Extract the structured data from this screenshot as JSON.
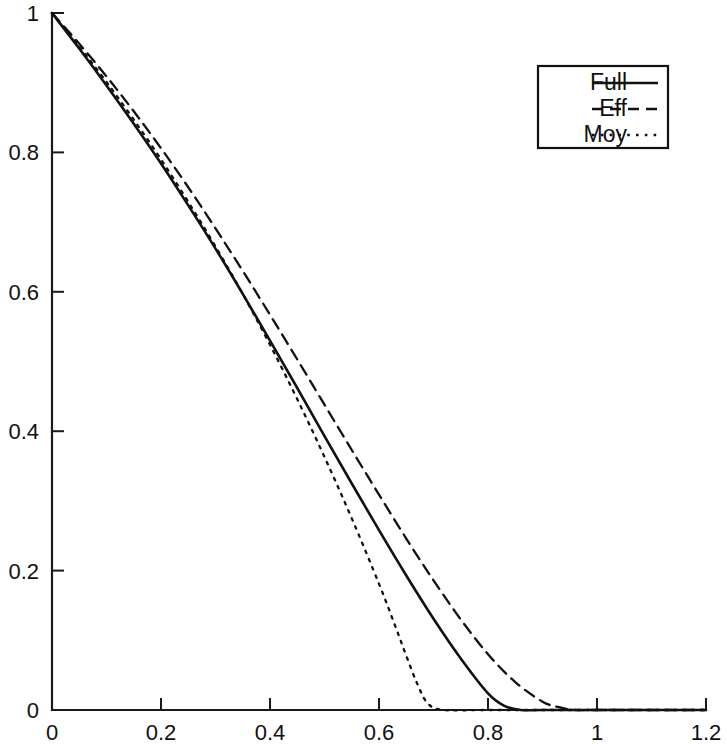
{
  "chart_data": {
    "type": "line",
    "title": "",
    "subtitle": "",
    "xlabel": "",
    "ylabel": "",
    "xlim": [
      0,
      1.2
    ],
    "ylim": [
      0,
      1
    ],
    "grid": false,
    "legend_position": "top-right",
    "xticks": [
      0,
      0.2,
      0.4,
      0.6,
      0.8,
      1,
      1.2
    ],
    "xtick_labels": [
      "0",
      "0.2",
      "0.4",
      "0.6",
      "0.8",
      "1",
      "1.2"
    ],
    "yticks": [
      0,
      0.2,
      0.4,
      0.6,
      0.8,
      1
    ],
    "ytick_labels": [
      "0",
      "0.2",
      "0.4",
      "0.6",
      "0.8",
      "1"
    ],
    "series": [
      {
        "name": "Full",
        "style": "solid",
        "x": [
          0,
          0.05,
          0.1,
          0.15,
          0.2,
          0.25,
          0.3,
          0.35,
          0.4,
          0.45,
          0.5,
          0.55,
          0.6,
          0.65,
          0.7,
          0.75,
          0.8,
          0.83,
          0.86,
          0.9,
          1.0,
          1.2
        ],
        "values": [
          1.0,
          0.949,
          0.896,
          0.841,
          0.784,
          0.724,
          0.662,
          0.597,
          0.53,
          0.462,
          0.393,
          0.325,
          0.258,
          0.193,
          0.131,
          0.074,
          0.024,
          0.006,
          0.0,
          0.0,
          0.0,
          0.0
        ]
      },
      {
        "name": "Eff",
        "style": "dashed",
        "x": [
          0,
          0.05,
          0.1,
          0.15,
          0.2,
          0.25,
          0.3,
          0.35,
          0.4,
          0.45,
          0.5,
          0.55,
          0.6,
          0.65,
          0.7,
          0.75,
          0.8,
          0.85,
          0.9,
          0.93,
          0.96,
          1.0,
          1.2
        ],
        "values": [
          1.0,
          0.956,
          0.909,
          0.859,
          0.806,
          0.75,
          0.691,
          0.63,
          0.567,
          0.503,
          0.438,
          0.373,
          0.309,
          0.246,
          0.186,
          0.13,
          0.08,
          0.04,
          0.012,
          0.004,
          0.0,
          0.0,
          0.0
        ]
      },
      {
        "name": "Moy",
        "style": "dotted",
        "x": [
          0,
          0.05,
          0.1,
          0.15,
          0.2,
          0.25,
          0.3,
          0.35,
          0.4,
          0.45,
          0.5,
          0.55,
          0.6,
          0.63,
          0.65,
          0.67,
          0.69,
          0.72,
          0.8,
          1.0,
          1.2
        ],
        "values": [
          1.0,
          0.952,
          0.901,
          0.847,
          0.79,
          0.729,
          0.665,
          0.597,
          0.524,
          0.446,
          0.363,
          0.275,
          0.181,
          0.12,
          0.078,
          0.038,
          0.009,
          0.0,
          0.0,
          0.0,
          0.0
        ]
      }
    ],
    "legend_entries": [
      {
        "label": "Full",
        "style": "solid"
      },
      {
        "label": "Eff",
        "style": "dashed"
      },
      {
        "label": "Moy",
        "style": "dotted"
      }
    ],
    "colors": {
      "curve": "#111111",
      "axis": "#1a1a1a",
      "background": "#ffffff"
    }
  }
}
